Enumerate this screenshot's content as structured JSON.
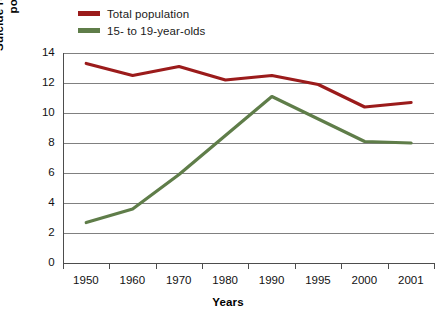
{
  "legend": {
    "items": [
      {
        "label": "Total population",
        "color": "#9b1b1b",
        "key": "total"
      },
      {
        "label": "15- to 19-year-olds",
        "color": "#5f7d49",
        "key": "teens"
      }
    ]
  },
  "axes": {
    "x_title": "Years",
    "y_title_line1": "Suicide rate per 100,000",
    "y_title_line2": "population",
    "y_ticks": [
      "0",
      "2",
      "4",
      "6",
      "8",
      "10",
      "12",
      "14"
    ],
    "x_ticks": [
      "1950",
      "1960",
      "1970",
      "1980",
      "1990",
      "1995",
      "2000",
      "2001"
    ]
  },
  "chart_data": {
    "type": "line",
    "title": "",
    "xlabel": "Years",
    "ylabel": "Suicide rate per 100,000 population",
    "categories": [
      "1950",
      "1960",
      "1970",
      "1980",
      "1990",
      "1995",
      "2000",
      "2001"
    ],
    "ylim": [
      0,
      14
    ],
    "ytick_step": 2,
    "grid": "horizontal",
    "legend_position": "top-left",
    "series": [
      {
        "name": "Total population",
        "color": "#9b1b1b",
        "values": [
          13.3,
          12.5,
          13.1,
          12.2,
          12.5,
          11.9,
          10.4,
          10.7
        ]
      },
      {
        "name": "15- to 19-year-olds",
        "color": "#5f7d49",
        "values": [
          2.7,
          3.6,
          5.9,
          8.5,
          11.1,
          9.6,
          8.1,
          8.0
        ]
      }
    ]
  }
}
